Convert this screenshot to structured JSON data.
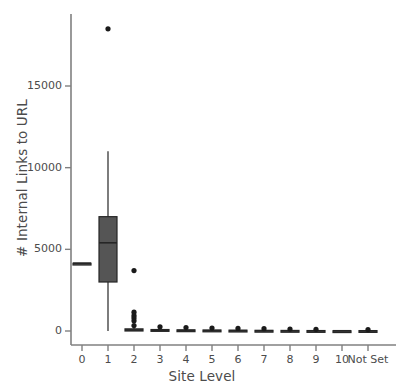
{
  "chart_data": {
    "type": "box",
    "title": "",
    "xlabel": "Site Level",
    "ylabel": "# Internal Links to URL",
    "categories": [
      "0",
      "1",
      "2",
      "3",
      "4",
      "5",
      "6",
      "7",
      "8",
      "9",
      "10",
      "Not Set"
    ],
    "ylim": [
      -700,
      19300
    ],
    "yticks": [
      0,
      5000,
      10000,
      15000
    ],
    "ytick_labels": [
      "0",
      "5000",
      "10000",
      "15000"
    ],
    "xticks": [
      0,
      1,
      2,
      3,
      4,
      5,
      6,
      7,
      8,
      9,
      10,
      11
    ],
    "grid": false,
    "legend": null,
    "box_color": "#555555",
    "line_color": "#262626",
    "axis_color": "#808080",
    "text_color": "#4c4c4c",
    "boxes": [
      {
        "category": "0",
        "q1": 4150,
        "median": 4150,
        "q3": 4150,
        "whisker_low": 4150,
        "whisker_high": 4150,
        "outliers": []
      },
      {
        "category": "1",
        "q1": 3000,
        "median": 5400,
        "q3": 7000,
        "whisker_low": 0,
        "whisker_high": 11000,
        "outliers": [
          18500
        ]
      },
      {
        "category": "2",
        "q1": 0,
        "median": 60,
        "q3": 130,
        "whisker_low": 0,
        "whisker_high": 300,
        "outliers": [
          3700,
          1150,
          950,
          800,
          620,
          330
        ]
      },
      {
        "category": "3",
        "q1": 0,
        "median": 40,
        "q3": 90,
        "whisker_low": 0,
        "whisker_high": 180,
        "outliers": [
          260
        ]
      },
      {
        "category": "4",
        "q1": 0,
        "median": 30,
        "q3": 70,
        "whisker_low": 0,
        "whisker_high": 150,
        "outliers": [
          210
        ]
      },
      {
        "category": "5",
        "q1": 0,
        "median": 25,
        "q3": 60,
        "whisker_low": 0,
        "whisker_high": 130,
        "outliers": [
          180
        ]
      },
      {
        "category": "6",
        "q1": 0,
        "median": 20,
        "q3": 50,
        "whisker_low": 0,
        "whisker_high": 110,
        "outliers": [
          160
        ]
      },
      {
        "category": "7",
        "q1": 0,
        "median": 15,
        "q3": 40,
        "whisker_low": 0,
        "whisker_high": 95,
        "outliers": [
          140
        ]
      },
      {
        "category": "8",
        "q1": 0,
        "median": 12,
        "q3": 35,
        "whisker_low": 0,
        "whisker_high": 85,
        "outliers": [
          120
        ]
      },
      {
        "category": "9",
        "q1": 0,
        "median": 10,
        "q3": 28,
        "whisker_low": 0,
        "whisker_high": 70,
        "outliers": [
          100
        ]
      },
      {
        "category": "10",
        "q1": 15,
        "median": 15,
        "q3": 15,
        "whisker_low": 15,
        "whisker_high": 15,
        "outliers": []
      },
      {
        "category": "Not Set",
        "q1": 0,
        "median": 10,
        "q3": 25,
        "whisker_low": 0,
        "whisker_high": 60,
        "outliers": [
          90
        ]
      }
    ]
  },
  "axes": {
    "ylabel_text": "# Internal Links to URL",
    "xlabel_text": "Site Level",
    "ytick_labels": [
      "15000",
      "10000",
      "5000",
      "0"
    ],
    "xtick_labels": [
      "0",
      "1",
      "2",
      "3",
      "4",
      "5",
      "6",
      "7",
      "8",
      "9",
      "10",
      "Not Set"
    ]
  }
}
